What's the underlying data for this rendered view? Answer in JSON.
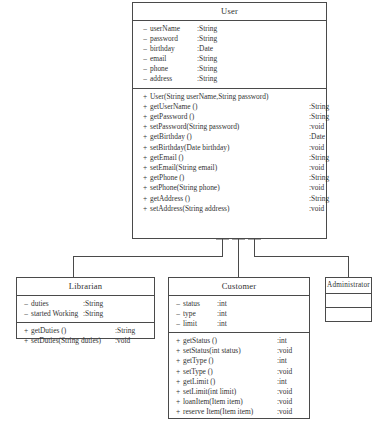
{
  "diagram": {
    "type": "uml-class-diagram",
    "classes": [
      {
        "id": "user",
        "name": "User",
        "attributes": [
          {
            "visibility": "–",
            "name": "userName",
            "type": ":String"
          },
          {
            "visibility": "–",
            "name": "password",
            "type": ":String"
          },
          {
            "visibility": "–",
            "name": "birthday",
            "type": ":Date"
          },
          {
            "visibility": "–",
            "name": "email",
            "type": ":String"
          },
          {
            "visibility": "–",
            "name": "phone",
            "type": ":String"
          },
          {
            "visibility": "–",
            "name": "address",
            "type": ":String"
          }
        ],
        "operations": [
          {
            "visibility": "+",
            "name": "User(String userName,String password)",
            "type": ""
          },
          {
            "visibility": "+",
            "name": "getUserName ()",
            "type": ":String"
          },
          {
            "visibility": "+",
            "name": "getPassword ()",
            "type": ":String"
          },
          {
            "visibility": "+",
            "name": "setPassword(String password)",
            "type": ":void"
          },
          {
            "visibility": "+",
            "name": "getBirthday ()",
            "type": ":Date"
          },
          {
            "visibility": "+",
            "name": "setBirthday(Date birthday)",
            "type": ":void"
          },
          {
            "visibility": "+",
            "name": "getEmail ()",
            "type": ":String"
          },
          {
            "visibility": "+",
            "name": "setEmail(String email)",
            "type": ":void"
          },
          {
            "visibility": "+",
            "name": "getPhone ()",
            "type": ":String"
          },
          {
            "visibility": "+",
            "name": "setPhone(String phone)",
            "type": ":void"
          },
          {
            "visibility": "+",
            "name": "getAddress ()",
            "type": ":String"
          },
          {
            "visibility": "+",
            "name": "setAddress(String address)",
            "type": ":void"
          }
        ]
      },
      {
        "id": "librarian",
        "name": "Librarian",
        "attributes": [
          {
            "visibility": "–",
            "name": "duties",
            "type": ":String"
          },
          {
            "visibility": "–",
            "name": "started Working",
            "type": ":String"
          }
        ],
        "operations": [
          {
            "visibility": "+",
            "name": "getDuties ()",
            "type": ":String"
          },
          {
            "visibility": "+",
            "name": "setDuties(String duties)",
            "type": ":void"
          }
        ]
      },
      {
        "id": "customer",
        "name": "Customer",
        "attributes": [
          {
            "visibility": "–",
            "name": "status",
            "type": ":int"
          },
          {
            "visibility": "–",
            "name": "type",
            "type": ":int"
          },
          {
            "visibility": "–",
            "name": "limit",
            "type": ":int"
          }
        ],
        "operations": [
          {
            "visibility": "+",
            "name": "getStatus ()",
            "type": ":int"
          },
          {
            "visibility": "+",
            "name": "setStatus(int status)",
            "type": ":void"
          },
          {
            "visibility": "+",
            "name": "getType ()",
            "type": ":int"
          },
          {
            "visibility": "+",
            "name": "setType ()",
            "type": ":void"
          },
          {
            "visibility": "+",
            "name": "getLimit ()",
            "type": ":int"
          },
          {
            "visibility": "+",
            "name": "setLimit(int limit)",
            "type": ":void"
          },
          {
            "visibility": "+",
            "name": "loanItem(Item item)",
            "type": ":void"
          },
          {
            "visibility": "+",
            "name": "reserve Item(Item item)",
            "type": ":void"
          }
        ]
      },
      {
        "id": "administrator",
        "name": "Administrator",
        "attributes": [],
        "operations": []
      }
    ],
    "relationships": [
      {
        "type": "generalization",
        "from": "Librarian",
        "to": "User"
      },
      {
        "type": "generalization",
        "from": "Customer",
        "to": "User"
      },
      {
        "type": "generalization",
        "from": "Administrator",
        "to": "User"
      }
    ],
    "colors": {
      "stroke": "#4a4a4a",
      "text": "#333333",
      "background": "#ffffff"
    }
  }
}
